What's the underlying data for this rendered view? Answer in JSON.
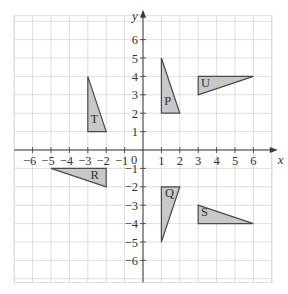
{
  "diagram": {
    "type": "coordinate-grid-transformations",
    "axes": {
      "x_label": "x",
      "y_label": "y",
      "origin_label": "0",
      "x_range": [
        -7,
        7
      ],
      "y_range": [
        -7.2,
        7.3
      ],
      "x_ticks": [
        -6,
        -5,
        -4,
        -3,
        -2,
        -1,
        1,
        2,
        3,
        4,
        5,
        6
      ],
      "y_ticks": [
        -6,
        -5,
        -4,
        -3,
        -2,
        -1,
        1,
        2,
        3,
        4,
        5,
        6
      ],
      "x_tick_labels": [
        "−6",
        "−5",
        "−4",
        "−3",
        "−2",
        "−1",
        "1",
        "2",
        "3",
        "4",
        "5",
        "6"
      ],
      "y_tick_labels": [
        "−6",
        "−5",
        "−4",
        "−3",
        "−2",
        "−1",
        "1",
        "2",
        "3",
        "4",
        "5",
        "6"
      ]
    },
    "style": {
      "shape_fill": "#c8c8c8",
      "shape_stroke": "#4a4a4a",
      "grid_color": "#d6d6d6",
      "axis_color": "#3a3a3a"
    },
    "shapes": [
      {
        "label": "T",
        "vertices": [
          [
            -3,
            4
          ],
          [
            -3,
            1
          ],
          [
            -2,
            1
          ]
        ],
        "label_pos": [
          -2.85,
          1.45
        ]
      },
      {
        "label": "P",
        "vertices": [
          [
            1,
            5
          ],
          [
            1,
            2
          ],
          [
            2,
            2
          ]
        ],
        "label_pos": [
          1.15,
          2.45
        ]
      },
      {
        "label": "U",
        "vertices": [
          [
            3,
            4
          ],
          [
            6,
            4
          ],
          [
            3,
            3
          ]
        ],
        "label_pos": [
          3.15,
          3.45
        ]
      },
      {
        "label": "R",
        "vertices": [
          [
            -5,
            -1
          ],
          [
            -2,
            -1
          ],
          [
            -2,
            -2
          ]
        ],
        "label_pos": [
          -2.85,
          -1.55
        ]
      },
      {
        "label": "Q",
        "vertices": [
          [
            1,
            -2
          ],
          [
            2,
            -2
          ],
          [
            1,
            -5
          ]
        ],
        "label_pos": [
          1.2,
          -2.55
        ]
      },
      {
        "label": "S",
        "vertices": [
          [
            3,
            -3
          ],
          [
            3,
            -4
          ],
          [
            6,
            -4
          ]
        ],
        "label_pos": [
          3.15,
          -3.6
        ]
      }
    ]
  }
}
